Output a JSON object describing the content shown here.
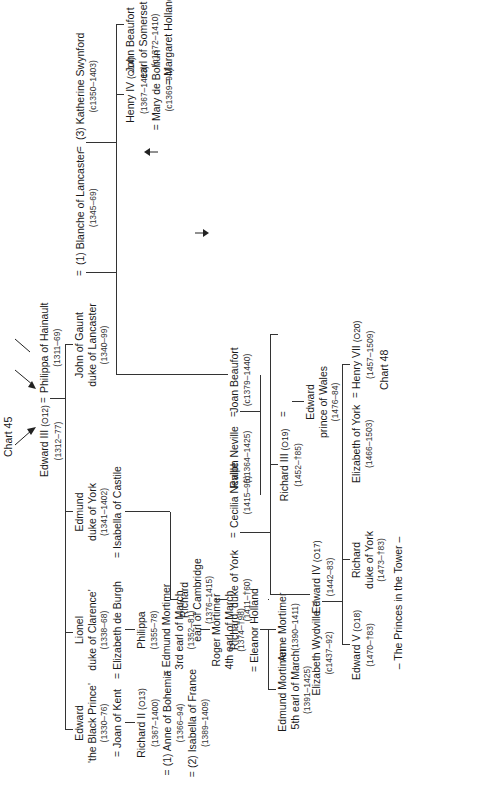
{
  "chart_refs": {
    "top": "Chart 45",
    "tudor": "Chart 17",
    "bottom": "Chart 48",
    "stanley": "(Chart 44)"
  },
  "people": {
    "edward3": {
      "name": "Edward III",
      "ref": "(O12)",
      "dates": "(1312–77)"
    },
    "philippa_hainault": {
      "name": "Philippa of Hainault",
      "dates": "(1311–69)"
    },
    "black_prince": {
      "l1": "Edward",
      "l2": "'the Black Prince'",
      "dates": "(1330–76)",
      "spouse": "= Joan of Kent"
    },
    "lionel": {
      "l1": "Lionel",
      "l2": "duke of Clarence'",
      "dates": "(1338–68)",
      "spouse": "= Elizabeth de Burgh"
    },
    "edmund_york": {
      "l1": "Edmund",
      "l2": "duke of York",
      "dates": "(1341–1402)",
      "spouse": "= Isabella of Castile"
    },
    "john_gaunt": {
      "l1": "John of Gaunt",
      "l2": "duke of Lancaster",
      "dates": "(1340–99)"
    },
    "blanche": {
      "name": "(1) Blanche of Lancaster",
      "dates": "(1345–69)"
    },
    "katherine_swynford": {
      "name": "(3) Katherine Swynford",
      "dates": "(c1350–1403)"
    },
    "richard2": {
      "name": "Richard II",
      "ref": "(O13)",
      "dates": "(1367–1400)",
      "spouse1": "= (1) Anne of Bohemia",
      "spouse1_dates": "(1366–94)",
      "spouse2": "= (2) Isabella of France",
      "spouse2_dates": "(1389–1409)"
    },
    "philippa": {
      "name": "Philippa",
      "dates": "(1355–78)",
      "spouse": "= Edmund Mortimer",
      "spouse_title": "3rd earl of March",
      "spouse_dates": "(1352–81)"
    },
    "roger_mortimer": {
      "l1": "Roger Mortimer",
      "l2": "4th earl of March",
      "dates": "(1374–†98)",
      "spouse": "= Eleanor Holland"
    },
    "edmund_mortimer5": {
      "l1": "Edmund Mortimer",
      "l2": "5th earl of March",
      "dates": "(1391–1425)"
    },
    "anne_mortimer": {
      "name": "Anne Mortimer",
      "dates": "(1390–1411)"
    },
    "richard_cambridge": {
      "l1": "Richard",
      "l2": "earl of Cambridge",
      "dates": "(1376–1415)"
    },
    "richard_york": {
      "name": "Richard, duke of York",
      "dates": "(1411–†60)"
    },
    "cecilia_neville": {
      "name": "Cecilia Neville",
      "dates": "(1415–95)"
    },
    "ralph_neville": {
      "name": "Ralph Neville",
      "dates": "(c1364–1425)"
    },
    "joan_beaufort": {
      "name": "Joan Beaufort",
      "dates": "(c1379–1440)"
    },
    "henry4": {
      "name": "Henry IV",
      "ref": "(O14)",
      "dates": "(1367–1413)",
      "spouse": "= Mary de Bohun",
      "spouse_dates": "(c1369–94)"
    },
    "henry5": {
      "name": "Henry V",
      "ref": "(O15)",
      "dates": "(1387–1422)"
    },
    "katherine_france": {
      "name": "Katherine of France",
      "dates": "(1401–37)"
    },
    "owen_tudor": {
      "name": "Owen Tudor",
      "dates": "(1400–61)"
    },
    "henry6": {
      "name": "Henry VI",
      "ref": "(O16)",
      "dates": "(1421–†71)",
      "spouse": "= Margaret of Anjou",
      "spouse_dates": "(1429–82)"
    },
    "edward_pow_lanc": {
      "l1": "Edward",
      "l2": "prince of Wales",
      "dates": "(1453–†71)"
    },
    "edmund_tudor": {
      "l1": "Edmund Tudor",
      "l2": "earl of Richmond",
      "dates": "(c1430–56)"
    },
    "john_beaufort1": {
      "l1": "John Beaufort",
      "l2": "earl of Somerset",
      "dates": "(c1372–1410)",
      "spouse": "= Margaret Holland"
    },
    "john_beaufort2": {
      "l1": "John Beaufort",
      "l2": "earl of Somerset",
      "dates": "(1404–44)",
      "spouse": "= Margaret Beauchamp"
    },
    "margaret_beaufort": {
      "l1": "Margaret Beaufort",
      "dates": "(1443–1509)",
      "l3": "married secondly",
      "l4": "Thomas (N456)",
      "l5": "Baron Stanley"
    },
    "richard_salisbury": {
      "l1": "Richard",
      "l2": "earl of Salisbury",
      "dates": "(c1400–†60)"
    },
    "warwick": {
      "name": "Richard Neville 'kingmaker'",
      "dates": "(1428–†71)"
    },
    "anne_neville": {
      "name": "Anne Neville",
      "dates": "(1456–85)"
    },
    "richard3": {
      "name": "Richard III",
      "ref": "(O19)",
      "dates": "(1452–†85)"
    },
    "edward_pow_york": {
      "l1": "Edward",
      "l2": "prince of Wales",
      "dates": "(1476–84)"
    },
    "edward4": {
      "name": "Edward IV",
      "ref": "(O17)",
      "dates": "(1442–83)"
    },
    "elizabeth_wydville": {
      "name": "Elizabeth Wydville",
      "dates": "(c1437–92)"
    },
    "edward5": {
      "name": "Edward V",
      "ref": "(O18)",
      "dates": "(1470–†83)"
    },
    "richard_york2": {
      "l1": "Richard",
      "l2": "duke of York",
      "dates": "(1473–†83)"
    },
    "princes": {
      "label": "– The Princes in the Tower –"
    },
    "elizabeth_york": {
      "name": "Elizabeth of York",
      "dates": "(1466–1503)"
    },
    "henry7": {
      "name": "Henry VII",
      "ref": "(O20)",
      "dates": "(1457–1509)"
    }
  },
  "symbols": {
    "eq": "="
  }
}
